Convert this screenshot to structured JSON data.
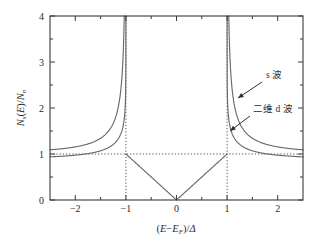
{
  "figure": {
    "background": "#ffffff",
    "curve_color": "#6a6a6a",
    "axis_color": "#3a3a3a",
    "text_color": "#2b2b2b"
  },
  "axes": {
    "x_title_parts": {
      "open": "(",
      "E1": "E",
      "minus": "−",
      "E2": "E",
      "E2sub": "F",
      "close": ")/",
      "delta": "Δ"
    },
    "y_title_parts": {
      "N1": "N",
      "N1sub": "s",
      "open": "(",
      "E": "E",
      "close": ")/",
      "N2": "N",
      "N2sub": "n"
    },
    "x_ticks": [
      "-2",
      "-1",
      "0",
      "1",
      "2"
    ],
    "x_tick_values": [
      -2,
      -1,
      0,
      1,
      2
    ],
    "x_minor_values": [
      -1.5,
      -0.5,
      0.5,
      1.5
    ],
    "y_ticks": [
      "0",
      "1",
      "2",
      "3",
      "4"
    ],
    "y_tick_values": [
      0,
      1,
      2,
      3,
      4
    ],
    "y_minor_values": [
      0.5,
      1.5,
      2.5,
      3.5
    ],
    "xlim": [
      -2.5,
      2.5
    ],
    "ylim": [
      0,
      4
    ]
  },
  "annotations": [
    {
      "id": "s-wave",
      "label": "s 波",
      "label_x": 266,
      "label_y": 78,
      "arrow_from": [
        262,
        82
      ],
      "arrow_to": [
        238,
        98
      ]
    },
    {
      "id": "d-wave",
      "label": "二维 d 波",
      "label_x": 253,
      "label_y": 112,
      "arrow_from": [
        250,
        116
      ],
      "arrow_to": [
        230,
        131
      ]
    }
  ],
  "guides": {
    "horizontal_value": 1,
    "vertical_values": [
      -1,
      1
    ]
  },
  "chart_data": {
    "type": "line",
    "title": "",
    "xlabel": "(E−E_F)/Δ",
    "ylabel": "N_s(E)/N_n",
    "xlim": [
      -2.5,
      2.5
    ],
    "ylim": [
      0,
      4
    ],
    "grid": false,
    "legend_position": "inline-annotations",
    "reference_lines": {
      "horizontal": [
        1
      ],
      "vertical": [
        -1,
        1
      ],
      "style": "dotted"
    },
    "series": [
      {
        "name": "s 波",
        "description": "BCS s-wave normalized density of states: N(E)/Nn = |E|/sqrt(E^2-1) for |E|>1, 0 for |E|<1",
        "x": [
          -2.5,
          -2.4,
          -2.3,
          -2.2,
          -2.1,
          -2.0,
          -1.9,
          -1.8,
          -1.7,
          -1.6,
          -1.5,
          -1.4,
          -1.3,
          -1.25,
          -1.2,
          -1.15,
          -1.1,
          -1.08,
          -1.06,
          -1.05,
          -1.04,
          -1.03,
          -1.02,
          -1.015,
          -1.01,
          -1.008,
          -1.006,
          -1.004,
          -1.0035,
          -1.0,
          1.0,
          1.0035,
          1.004,
          1.006,
          1.008,
          1.01,
          1.015,
          1.02,
          1.03,
          1.04,
          1.05,
          1.06,
          1.08,
          1.1,
          1.15,
          1.2,
          1.25,
          1.3,
          1.4,
          1.5,
          1.6,
          1.7,
          1.8,
          1.9,
          2.0,
          2.1,
          2.2,
          2.3,
          2.4,
          2.5
        ],
        "y": [
          1.091,
          1.099,
          1.107,
          1.117,
          1.128,
          1.155,
          1.155,
          1.172,
          1.191,
          1.214,
          1.342,
          1.278,
          1.327,
          1.358,
          1.396,
          1.445,
          1.511,
          1.551,
          1.603,
          1.635,
          1.674,
          1.722,
          1.785,
          1.826,
          1.879,
          1.907,
          1.942,
          1.987,
          2.0,
          4.0,
          4.0,
          2.0,
          1.987,
          1.942,
          1.907,
          1.879,
          1.826,
          1.785,
          1.722,
          1.674,
          1.635,
          1.603,
          1.551,
          1.511,
          1.445,
          1.396,
          1.358,
          1.327,
          1.278,
          1.342,
          1.214,
          1.191,
          1.172,
          1.155,
          1.155,
          1.128,
          1.117,
          1.107,
          1.099,
          1.091
        ]
      },
      {
        "name": "二维 d 波",
        "description": "Two-dimensional d-wave normalized density of states: linear |E|/Delta inside gap, logarithmic divergence at |E|=Delta, approaching 1 at large |E|",
        "x": [
          -2.5,
          -2.25,
          -2.0,
          -1.75,
          -1.5,
          -1.4,
          -1.3,
          -1.2,
          -1.15,
          -1.1,
          -1.06,
          -1.03,
          -1.01,
          -1.0,
          -0.95,
          -0.9,
          -0.8,
          -0.7,
          -0.6,
          -0.5,
          -0.4,
          -0.3,
          -0.2,
          -0.1,
          0.0,
          0.1,
          0.2,
          0.3,
          0.4,
          0.5,
          0.6,
          0.7,
          0.8,
          0.9,
          0.95,
          1.0,
          1.01,
          1.03,
          1.06,
          1.1,
          1.15,
          1.2,
          1.3,
          1.4,
          1.5,
          1.75,
          2.0,
          2.25,
          2.5
        ],
        "y": [
          1.04,
          1.05,
          1.06,
          1.08,
          1.12,
          1.14,
          1.18,
          1.24,
          1.29,
          1.36,
          1.46,
          1.62,
          1.9,
          4.0,
          0.95,
          0.9,
          0.8,
          0.7,
          0.6,
          0.5,
          0.4,
          0.3,
          0.2,
          0.1,
          0.0,
          0.1,
          0.2,
          0.3,
          0.4,
          0.5,
          0.6,
          0.7,
          0.8,
          0.9,
          0.95,
          4.0,
          1.9,
          1.62,
          1.46,
          1.36,
          1.29,
          1.24,
          1.18,
          1.14,
          1.12,
          1.08,
          1.06,
          1.05,
          1.04
        ]
      }
    ]
  }
}
